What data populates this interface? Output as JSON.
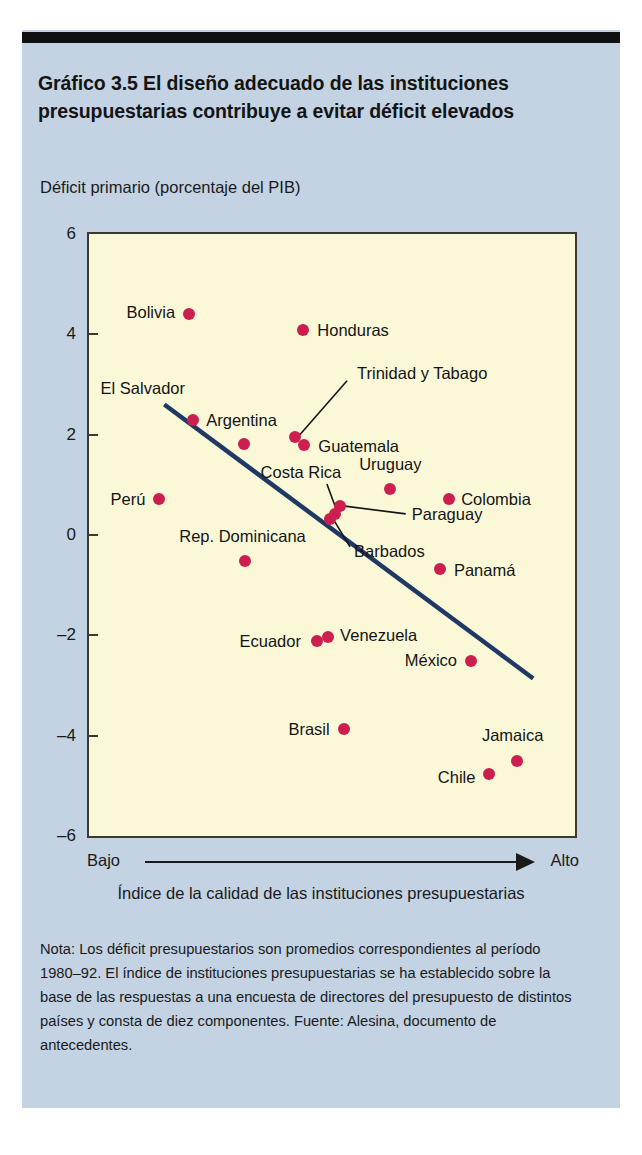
{
  "figure": {
    "title": "Gráfico 3.5 El diseño adecuado de las instituciones presupuestarias contribuye a evitar déficit elevados",
    "note": "Nota: Los déficit presupuestarios son promedios correspondientes al período 1980–92. El índice de instituciones presupuestarias se ha establecido sobre la base de las respuestas a una encuesta de directores del presupuesto de distintos países y consta de diez componentes. Fuente: Alesina, documento de antecedentes.",
    "colors": {
      "card_background": "#c3d3e3",
      "plot_background": "#fbf8d8",
      "point": "#cc1f50",
      "trendline": "#1f3864",
      "frame": "#3a3a30",
      "rule": "#111111"
    }
  },
  "axis": {
    "low_label": "Bajo",
    "high_label": "Alto",
    "x_caption": "Índice de la calidad de las instituciones presupuestarias",
    "y_caption": "Déficit primario (porcentaje del PIB)"
  },
  "chart_data": {
    "type": "scatter",
    "title": "Gráfico 3.5 El diseño adecuado de las instituciones presupuestarias contribuye a evitar déficit elevados",
    "xlabel": "Índice de la calidad de las instituciones presupuestarias",
    "ylabel": "Déficit primario (porcentaje del PIB)",
    "ylim": [
      -6,
      6
    ],
    "yticks": [
      6,
      4,
      2,
      0,
      -2,
      -4,
      -6
    ],
    "ytick_labels": [
      "6",
      "4",
      "2",
      "0",
      "-2",
      "-4",
      "-6"
    ],
    "xlim": [
      0,
      1
    ],
    "x_is_qualitative": true,
    "x_axis_endpoints": [
      "Bajo",
      "Alto"
    ],
    "grid": false,
    "legend": "none",
    "points": [
      {
        "name": "Bolivia",
        "x": 0.206,
        "y": 4.4,
        "label_side": "left"
      },
      {
        "name": "Honduras",
        "x": 0.441,
        "y": 4.08,
        "label_side": "right"
      },
      {
        "name": "El Salvador",
        "x": 0.214,
        "y": 2.3,
        "label_side": "above-left"
      },
      {
        "name": "Argentina",
        "x": 0.318,
        "y": 1.82,
        "label_side": "above"
      },
      {
        "name": "Trinidad y Tabago",
        "x": 0.424,
        "y": 1.96,
        "label_side": "leader"
      },
      {
        "name": "Guatemala",
        "x": 0.443,
        "y": 1.8,
        "label_side": "right"
      },
      {
        "name": "Perú",
        "x": 0.145,
        "y": 0.72,
        "label_side": "left"
      },
      {
        "name": "Uruguay",
        "x": 0.62,
        "y": 0.92,
        "label_side": "above"
      },
      {
        "name": "Colombia",
        "x": 0.741,
        "y": 0.72,
        "label_side": "right"
      },
      {
        "name": "Paraguay",
        "x": 0.516,
        "y": 0.58,
        "label_side": "leader"
      },
      {
        "name": "Costa Rica",
        "x": 0.506,
        "y": 0.42,
        "label_side": "leader"
      },
      {
        "name": "Barbados",
        "x": 0.496,
        "y": 0.32,
        "label_side": "leader"
      },
      {
        "name": "Rep. Dominicana",
        "x": 0.32,
        "y": -0.52,
        "label_side": "above"
      },
      {
        "name": "Panamá",
        "x": 0.722,
        "y": -0.68,
        "label_side": "right"
      },
      {
        "name": "Ecuador",
        "x": 0.469,
        "y": -2.12,
        "label_side": "left"
      },
      {
        "name": "Venezuela",
        "x": 0.492,
        "y": -2.04,
        "label_side": "right"
      },
      {
        "name": "México",
        "x": 0.786,
        "y": -2.52,
        "label_side": "left"
      },
      {
        "name": "Brasil",
        "x": 0.524,
        "y": -3.86,
        "label_side": "left"
      },
      {
        "name": "Jamaica",
        "x": 0.88,
        "y": -4.5,
        "label_side": "above"
      },
      {
        "name": "Chile",
        "x": 0.824,
        "y": -4.76,
        "label_side": "left"
      }
    ],
    "trendline": {
      "description": "línea de tendencia descendente",
      "x_start": 0.155,
      "y_start": 2.6,
      "x_end": 0.914,
      "y_end": -2.86
    }
  }
}
